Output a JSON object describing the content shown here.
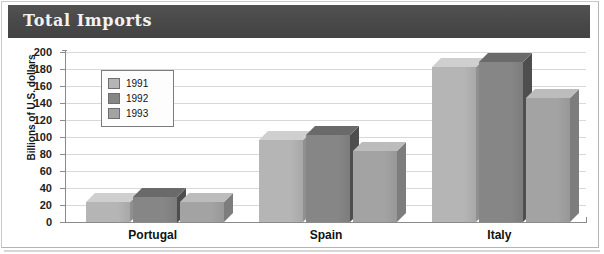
{
  "title": "Total Imports",
  "axis": {
    "ylabel": "Billions of U.S. dollars",
    "yticks": [
      "200",
      "180",
      "160",
      "140",
      "120",
      "100",
      "80",
      "60",
      "40",
      "20",
      "0"
    ]
  },
  "legend": {
    "items": [
      {
        "label": "1991",
        "color": "#b5b5b5"
      },
      {
        "label": "1992",
        "color": "#868686"
      },
      {
        "label": "1993",
        "color": "#a3a3a3"
      }
    ]
  },
  "colors": {
    "title_bar": "#4b4b4b",
    "title_text": "#f2f2f2",
    "gridline": "#d8d8d8",
    "axis": "#8b8b8b",
    "series_1991_front": "#b5b5b5",
    "series_1991_top": "#cfcfcf",
    "series_1991_side": "#909090",
    "series_1992_front": "#868686",
    "series_1992_top": "#6a6a6a",
    "series_1992_side": "#4e4e4e",
    "series_1993_front": "#a3a3a3",
    "series_1993_top": "#bcbcbc",
    "series_1993_side": "#7d7d7d"
  },
  "chart_data": {
    "type": "bar",
    "title": "Total Imports",
    "xlabel": "",
    "ylabel": "Billions of U.S. dollars",
    "ylim": [
      0,
      200
    ],
    "ytick_step": 20,
    "grid": true,
    "legend_position": "upper-left-inside",
    "categories": [
      "Portugal",
      "Spain",
      "Italy"
    ],
    "series": [
      {
        "name": "1991",
        "values": [
          24,
          96,
          182
        ]
      },
      {
        "name": "1992",
        "values": [
          30,
          102,
          188
        ]
      },
      {
        "name": "1993",
        "values": [
          23,
          84,
          146
        ]
      }
    ]
  }
}
